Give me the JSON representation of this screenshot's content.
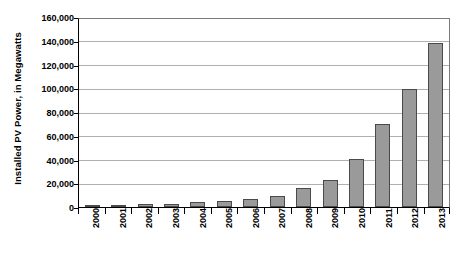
{
  "chart_data": {
    "type": "bar",
    "title": "",
    "xlabel": "",
    "ylabel": "Installed PV Power, in Megawatts",
    "ylim": [
      0,
      160000
    ],
    "grid": true,
    "legend": "none",
    "orientation": "vertical",
    "categories": [
      "2000",
      "2001",
      "2002",
      "2003",
      "2004",
      "2005",
      "2006",
      "2007",
      "2008",
      "2009",
      "2010",
      "2011",
      "2012",
      "2013"
    ],
    "values": [
      1400,
      1800,
      2200,
      2800,
      3900,
      5400,
      7000,
      9500,
      16000,
      23500,
      41000,
      71000,
      101000,
      140000
    ],
    "ytick_labels": [
      "160,000",
      "140,000",
      "120,000",
      "100,000",
      "80,000",
      "60,000",
      "40,000",
      "20,000",
      "0"
    ],
    "ytick_values": [
      160000,
      140000,
      120000,
      100000,
      80000,
      60000,
      40000,
      20000,
      0
    ],
    "bar_fill_color": "#9a9a9a",
    "bar_border_color": "#4a4a4a",
    "gridline_color": "#b0b0b0",
    "axis_color": "#000000",
    "background_color": "#ffffff"
  }
}
